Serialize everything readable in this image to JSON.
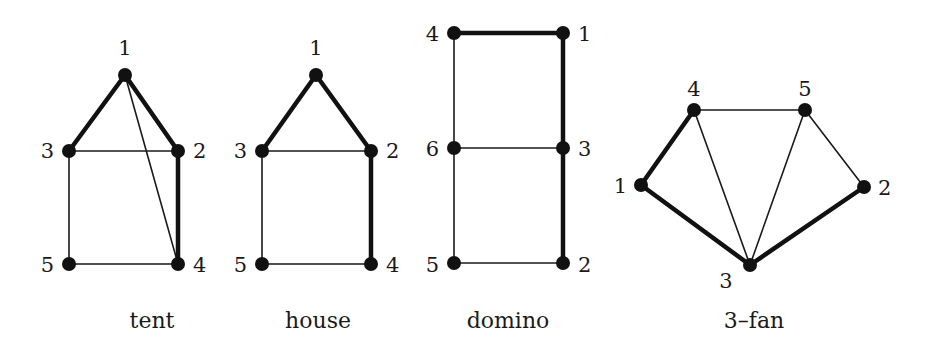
{
  "figure": {
    "colors": {
      "ink": "#111111",
      "background": "#ffffff"
    },
    "node_radius": 7,
    "graphs": [
      {
        "name": "tent",
        "caption": "tent",
        "caption_pos": [
          152,
          328
        ],
        "nodes": [
          {
            "id": "1",
            "x": 125,
            "y": 75,
            "label_x": 125,
            "label_y": 55,
            "anchor": "middle"
          },
          {
            "id": "2",
            "x": 178,
            "y": 151,
            "label_x": 193,
            "label_y": 158,
            "anchor": "start"
          },
          {
            "id": "3",
            "x": 69,
            "y": 151,
            "label_x": 54,
            "label_y": 158,
            "anchor": "end"
          },
          {
            "id": "4",
            "x": 178,
            "y": 264,
            "label_x": 193,
            "label_y": 272,
            "anchor": "start"
          },
          {
            "id": "5",
            "x": 69,
            "y": 264,
            "label_x": 54,
            "label_y": 272,
            "anchor": "end"
          }
        ],
        "edges": [
          {
            "from": "1",
            "to": "3",
            "thick": true
          },
          {
            "from": "1",
            "to": "2",
            "thick": true
          },
          {
            "from": "2",
            "to": "4",
            "thick": true
          },
          {
            "from": "3",
            "to": "2",
            "thick": false
          },
          {
            "from": "3",
            "to": "5",
            "thick": false
          },
          {
            "from": "5",
            "to": "4",
            "thick": false
          },
          {
            "from": "1",
            "to": "4",
            "thick": false
          }
        ]
      },
      {
        "name": "house",
        "caption": "house",
        "caption_pos": [
          318,
          328
        ],
        "nodes": [
          {
            "id": "1",
            "x": 316,
            "y": 75,
            "label_x": 316,
            "label_y": 55,
            "anchor": "middle"
          },
          {
            "id": "2",
            "x": 371,
            "y": 151,
            "label_x": 386,
            "label_y": 158,
            "anchor": "start"
          },
          {
            "id": "3",
            "x": 262,
            "y": 151,
            "label_x": 247,
            "label_y": 158,
            "anchor": "end"
          },
          {
            "id": "4",
            "x": 371,
            "y": 264,
            "label_x": 386,
            "label_y": 272,
            "anchor": "start"
          },
          {
            "id": "5",
            "x": 262,
            "y": 264,
            "label_x": 247,
            "label_y": 272,
            "anchor": "end"
          }
        ],
        "edges": [
          {
            "from": "1",
            "to": "3",
            "thick": true
          },
          {
            "from": "1",
            "to": "2",
            "thick": true
          },
          {
            "from": "2",
            "to": "4",
            "thick": true
          },
          {
            "from": "3",
            "to": "2",
            "thick": false
          },
          {
            "from": "3",
            "to": "5",
            "thick": false
          },
          {
            "from": "5",
            "to": "4",
            "thick": false
          }
        ]
      },
      {
        "name": "domino",
        "caption": "domino",
        "caption_pos": [
          508,
          328
        ],
        "nodes": [
          {
            "id": "1",
            "x": 563,
            "y": 33,
            "label_x": 578,
            "label_y": 41,
            "anchor": "start"
          },
          {
            "id": "2",
            "x": 563,
            "y": 263,
            "label_x": 578,
            "label_y": 272,
            "anchor": "start"
          },
          {
            "id": "3",
            "x": 563,
            "y": 148,
            "label_x": 578,
            "label_y": 156,
            "anchor": "start"
          },
          {
            "id": "4",
            "x": 454,
            "y": 33,
            "label_x": 439,
            "label_y": 41,
            "anchor": "end"
          },
          {
            "id": "5",
            "x": 454,
            "y": 263,
            "label_x": 439,
            "label_y": 272,
            "anchor": "end"
          },
          {
            "id": "6",
            "x": 454,
            "y": 148,
            "label_x": 439,
            "label_y": 156,
            "anchor": "end"
          }
        ],
        "edges": [
          {
            "from": "4",
            "to": "1",
            "thick": true
          },
          {
            "from": "1",
            "to": "3",
            "thick": true
          },
          {
            "from": "3",
            "to": "2",
            "thick": true
          },
          {
            "from": "4",
            "to": "6",
            "thick": false
          },
          {
            "from": "6",
            "to": "5",
            "thick": false
          },
          {
            "from": "6",
            "to": "3",
            "thick": false
          },
          {
            "from": "5",
            "to": "2",
            "thick": false
          }
        ]
      },
      {
        "name": "3-fan",
        "caption": "3–fan",
        "caption_pos": [
          754,
          328
        ],
        "nodes": [
          {
            "id": "1",
            "x": 641,
            "y": 185,
            "label_x": 627,
            "label_y": 193,
            "anchor": "end"
          },
          {
            "id": "2",
            "x": 864,
            "y": 187,
            "label_x": 878,
            "label_y": 195,
            "anchor": "start"
          },
          {
            "id": "3",
            "x": 750,
            "y": 265,
            "label_x": 726,
            "label_y": 288,
            "anchor": "middle"
          },
          {
            "id": "4",
            "x": 694,
            "y": 110,
            "label_x": 694,
            "label_y": 96,
            "anchor": "middle"
          },
          {
            "id": "5",
            "x": 805,
            "y": 110,
            "label_x": 805,
            "label_y": 96,
            "anchor": "middle"
          }
        ],
        "edges": [
          {
            "from": "1",
            "to": "4",
            "thick": true
          },
          {
            "from": "1",
            "to": "3",
            "thick": true
          },
          {
            "from": "3",
            "to": "2",
            "thick": true
          },
          {
            "from": "4",
            "to": "5",
            "thick": false
          },
          {
            "from": "4",
            "to": "3",
            "thick": false
          },
          {
            "from": "5",
            "to": "3",
            "thick": false
          },
          {
            "from": "5",
            "to": "2",
            "thick": false
          }
        ]
      }
    ]
  }
}
